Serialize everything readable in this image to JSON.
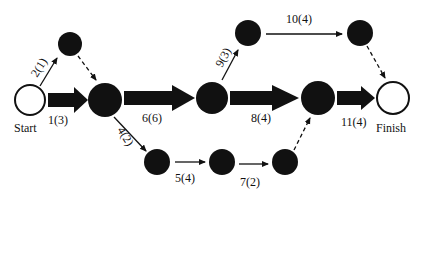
{
  "diagram": {
    "type": "activity-network",
    "nodes": [
      {
        "id": "start",
        "x": 30,
        "y": 100,
        "r": 15,
        "filled": false,
        "label": "Start"
      },
      {
        "id": "n1",
        "x": 70,
        "y": 44,
        "r": 12,
        "filled": true
      },
      {
        "id": "n2",
        "x": 105,
        "y": 100,
        "r": 17,
        "filled": true
      },
      {
        "id": "n3",
        "x": 212,
        "y": 98,
        "r": 16,
        "filled": true
      },
      {
        "id": "n4",
        "x": 248,
        "y": 33,
        "r": 13,
        "filled": true
      },
      {
        "id": "n5",
        "x": 360,
        "y": 33,
        "r": 13,
        "filled": true
      },
      {
        "id": "n6",
        "x": 318,
        "y": 98,
        "r": 17,
        "filled": true
      },
      {
        "id": "finish",
        "x": 393,
        "y": 98,
        "r": 16,
        "filled": false,
        "label": "Finish"
      },
      {
        "id": "n7",
        "x": 157,
        "y": 162,
        "r": 13,
        "filled": true
      },
      {
        "id": "n8",
        "x": 222,
        "y": 162,
        "r": 13,
        "filled": true
      },
      {
        "id": "n9",
        "x": 285,
        "y": 162,
        "r": 13,
        "filled": true
      }
    ],
    "activities": [
      {
        "label": "1(3)",
        "from": "start",
        "to": "n2",
        "critical": true
      },
      {
        "label": "2(1)",
        "from": "start",
        "to": "n1",
        "critical": false
      },
      {
        "label": "dummy",
        "from": "n1",
        "to": "n2",
        "dummy": true
      },
      {
        "label": "4(2)",
        "from": "n2",
        "to": "n7",
        "critical": false
      },
      {
        "label": "6(6)",
        "from": "n2",
        "to": "n3",
        "critical": true
      },
      {
        "label": "5(4)",
        "from": "n7",
        "to": "n8",
        "critical": false
      },
      {
        "label": "7(2)",
        "from": "n8",
        "to": "n9",
        "critical": false
      },
      {
        "label": "dummy",
        "from": "n9",
        "to": "n6",
        "dummy": true
      },
      {
        "label": "9(3)",
        "from": "n3",
        "to": "n4",
        "critical": false
      },
      {
        "label": "8(4)",
        "from": "n3",
        "to": "n6",
        "critical": true
      },
      {
        "label": "10(4)",
        "from": "n4",
        "to": "n5",
        "critical": false
      },
      {
        "label": "dummy",
        "from": "n5",
        "to": "finish",
        "dummy": true
      },
      {
        "label": "11(4)",
        "from": "n6",
        "to": "finish",
        "critical": true
      }
    ]
  },
  "labels": {
    "start": "Start",
    "finish": "Finish",
    "a1": "1(3)",
    "a2": "2(1)",
    "a4": "4(2)",
    "a5": "5(4)",
    "a6": "6(6)",
    "a7": "7(2)",
    "a8": "8(4)",
    "a9": "9(3)",
    "a10": "10(4)",
    "a11": "11(4)"
  },
  "colors": {
    "ink": "#111111",
    "background": "#ffffff"
  }
}
